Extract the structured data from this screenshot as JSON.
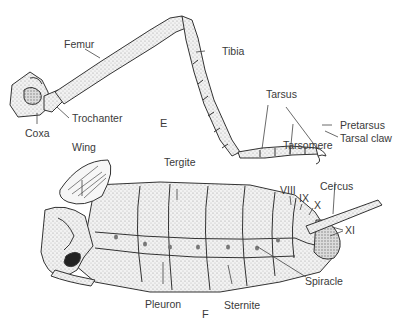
{
  "figure": {
    "panels": [
      {
        "id": "E",
        "label": "E",
        "subject": "insect leg",
        "parts": {
          "femur": "Femur",
          "tibia": "Tibia",
          "coxa": "Coxa",
          "trochanter": "Trochanter",
          "tarsus": "Tarsus",
          "pretarsus": "Pretarsus",
          "tarsal_claw": "Tarsal claw",
          "tarsomere": "Tarsomere"
        }
      },
      {
        "id": "F",
        "label": "F",
        "subject": "insect body (lateral view)",
        "parts": {
          "wing": "Wing",
          "tergite": "Tergite",
          "viii": "VIII",
          "ix": "IX",
          "x": "X",
          "cercus": "Cercus",
          "xi": "XI",
          "spiracle": "Spiracle",
          "pleuron": "Pleuron",
          "sternite": "Sternite"
        }
      }
    ],
    "colors": {
      "ink": "#333333",
      "label": "#3a3a3a",
      "shade": "#d9d9d9",
      "background": "#ffffff"
    }
  }
}
